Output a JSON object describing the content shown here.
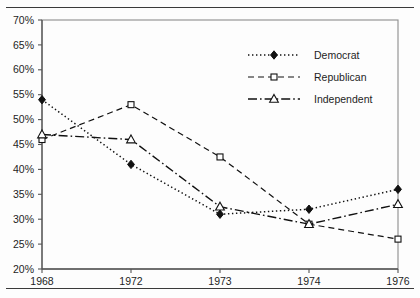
{
  "figure": {
    "has_top_rule": true,
    "has_bottom_rule": true,
    "rule_color": "#3a3a3a",
    "background": "#fdfdfd"
  },
  "chart_data": {
    "type": "line",
    "title": "",
    "subtitle": "",
    "xlabel": "",
    "ylabel": "",
    "categories": [
      "1968",
      "1972",
      "1973",
      "1974",
      "1976"
    ],
    "ylim": [
      20,
      70
    ],
    "ytick_values": [
      20,
      25,
      30,
      35,
      40,
      45,
      50,
      55,
      60,
      65,
      70
    ],
    "ytick_labels": [
      "20%",
      "25%",
      "30%",
      "35%",
      "40%",
      "45%",
      "50%",
      "55%",
      "60%",
      "65%",
      "70%"
    ],
    "xtick_labels": [
      "1968",
      "1972",
      "1973",
      "1974",
      "1976"
    ],
    "grid": false,
    "legend_position": "upper-right-inside",
    "series": [
      {
        "name": "Democrat",
        "values": [
          54,
          41,
          31,
          32,
          36
        ],
        "marker": "filled-diamond",
        "line_style": "dotted",
        "color": "#111111"
      },
      {
        "name": "Republican",
        "values": [
          46,
          53,
          42.5,
          29,
          26
        ],
        "marker": "open-square",
        "line_style": "dashed",
        "color": "#111111"
      },
      {
        "name": "Independent",
        "values": [
          47,
          46,
          32.5,
          29,
          33
        ],
        "marker": "open-triangle",
        "line_style": "dash-dot",
        "color": "#111111"
      }
    ],
    "legend_entries": [
      {
        "label": "Democrat",
        "marker": "filled-diamond",
        "line_style": "dotted"
      },
      {
        "label": "Republican",
        "marker": "open-square",
        "line_style": "dashed"
      },
      {
        "label": "Independent",
        "marker": "open-triangle",
        "line_style": "dash-dot"
      }
    ]
  }
}
